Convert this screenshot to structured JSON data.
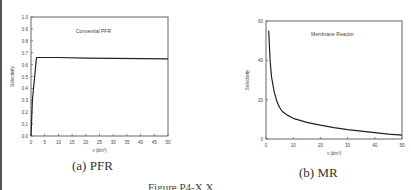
{
  "chart_data": [
    {
      "type": "line",
      "panel": "a",
      "title": "Convential PFR",
      "xlabel": "v (dm³)",
      "ylabel": "Selectivity",
      "xlim": [
        0,
        50
      ],
      "ylim": [
        0,
        1.0
      ],
      "xticks": [
        0,
        5,
        10,
        15,
        20,
        25,
        30,
        35,
        40,
        45,
        50
      ],
      "yticks": [
        0.0,
        0.1,
        0.2,
        0.3,
        0.4,
        0.5,
        0.6,
        0.7,
        0.8,
        0.9,
        1.0
      ],
      "ytick_labels": [
        "0.0",
        "0.1",
        "0.2",
        "0.3",
        "0.4",
        "0.5",
        "0.6",
        "0.7",
        "0.8",
        "0.9",
        "1.0"
      ],
      "grid": false,
      "series": [
        {
          "name": "Selectivity",
          "x": [
            0,
            0.5,
            2,
            10,
            20,
            30,
            40,
            50
          ],
          "y": [
            0.0,
            0.3,
            0.66,
            0.66,
            0.655,
            0.653,
            0.65,
            0.648
          ]
        }
      ],
      "caption": "(a) PFR"
    },
    {
      "type": "line",
      "panel": "b",
      "title": "Membrane Reactor",
      "xlabel": "v (dm³)",
      "ylabel": "Selectivity",
      "xlim": [
        0,
        50
      ],
      "ylim": [
        0,
        60
      ],
      "xticks": [
        0,
        10,
        20,
        30,
        40,
        50
      ],
      "yticks": [
        0,
        20,
        40,
        60
      ],
      "ytick_labels": [
        "0",
        "20",
        "40",
        "60"
      ],
      "grid": false,
      "series": [
        {
          "name": "Selectivity",
          "x": [
            1,
            1.5,
            2,
            3,
            4,
            5,
            6,
            8,
            10,
            15,
            20,
            25,
            30,
            35,
            40,
            45,
            50
          ],
          "y": [
            55,
            40,
            32,
            24,
            19,
            16,
            14,
            12,
            10.5,
            8.5,
            7,
            5.8,
            4.8,
            4,
            3.2,
            2.5,
            2
          ]
        }
      ],
      "caption": "(b) MR"
    }
  ],
  "figure_caption": "Figure P4-X.X"
}
